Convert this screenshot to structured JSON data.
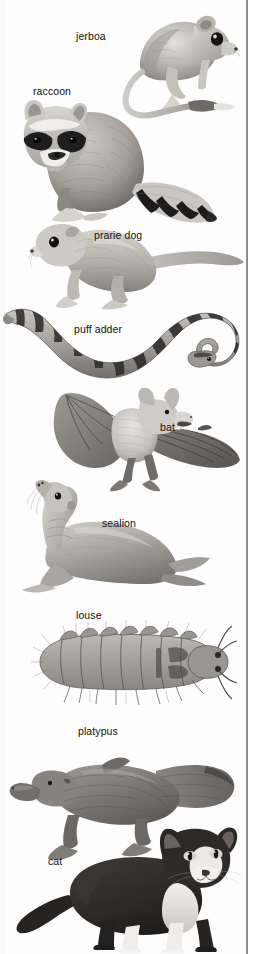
{
  "plate": {
    "title": "animal illustration plate",
    "medium": "grayscale pencil illustrations",
    "width_px": 257,
    "height_px": 954,
    "background_color": "#fdfdfd",
    "gutter_rule_color": "#8d8d8d"
  },
  "figures": [
    {
      "id": "jerboa",
      "label": "jerboa",
      "label_x": 76,
      "label_y": 30,
      "fig_x": 122,
      "fig_y": 4,
      "fig_w": 118,
      "fig_h": 118,
      "description": "jerboa, long hind legs, tufted tail, large eye and round ear"
    },
    {
      "id": "raccoon",
      "label": "raccoon",
      "label_x": 33,
      "label_y": 85,
      "fig_x": 10,
      "fig_y": 92,
      "fig_w": 215,
      "fig_h": 135,
      "description": "raccoon seated, masked face, ringed tail extending right"
    },
    {
      "id": "prarie-dog",
      "label": "prarie dog",
      "label_x": 94,
      "label_y": 229,
      "fig_x": 28,
      "fig_y": 218,
      "fig_w": 222,
      "fig_h": 92,
      "description": "prairie dog standing in profile, long tail to the right"
    },
    {
      "id": "puff-adder",
      "label": "puff adder",
      "label_x": 74,
      "label_y": 323,
      "fig_x": 2,
      "fig_y": 300,
      "fig_w": 248,
      "fig_h": 90,
      "description": "puff adder snake coiled in an S-curve with banded pattern"
    },
    {
      "id": "bat",
      "label": "bat",
      "label_x": 160,
      "label_y": 421,
      "fig_x": 28,
      "fig_y": 388,
      "fig_w": 220,
      "fig_h": 110,
      "description": "bat in flight with outspread wings, pale furred body"
    },
    {
      "id": "sealion",
      "label": "sealion",
      "label_x": 102,
      "label_y": 517,
      "fig_x": 18,
      "fig_y": 480,
      "fig_w": 200,
      "fig_h": 118,
      "description": "sea lion with head raised, resting on fore-flippers"
    },
    {
      "id": "louse",
      "label": "louse",
      "label_x": 76,
      "label_y": 609,
      "fig_x": 26,
      "fig_y": 620,
      "fig_w": 212,
      "fig_h": 85,
      "description": "louse seen from above, segmented body with bristles and antennae"
    },
    {
      "id": "platypus",
      "label": "platypus",
      "label_x": 78,
      "label_y": 725,
      "fig_x": 6,
      "fig_y": 745,
      "fig_w": 240,
      "fig_h": 120,
      "description": "platypus in profile, duck bill, flat tail, webbed feet"
    },
    {
      "id": "cat",
      "label": "cat",
      "label_x": 48,
      "label_y": 855,
      "fig_x": 10,
      "fig_y": 825,
      "fig_w": 232,
      "fig_h": 128,
      "description": "black-and-white cat standing, facing viewer"
    }
  ]
}
